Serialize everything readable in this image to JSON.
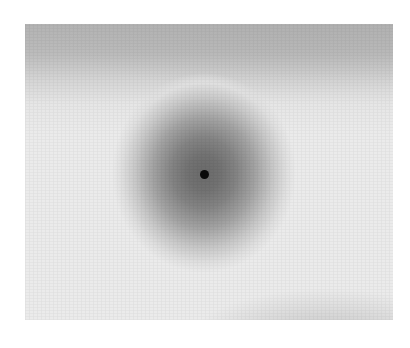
{
  "figure": {
    "colors": {
      "background": "#ebebeb",
      "top_band": "#b3b3b3",
      "blob_core": "#6a6a6a",
      "dot": "#0a0a0a",
      "lower_bump": "#c6c6c6",
      "page": "#ffffff"
    },
    "elements": [
      {
        "name": "top-dark-band",
        "shape": "gradient band"
      },
      {
        "name": "central-blob",
        "shape": "radial gradient"
      },
      {
        "name": "center-dot",
        "shape": "circle"
      },
      {
        "name": "lower-right-bump",
        "shape": "elliptical gradient"
      }
    ]
  },
  "caption": {
    "text": ""
  }
}
